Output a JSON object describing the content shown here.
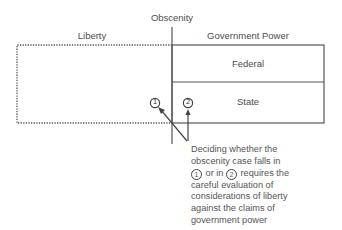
{
  "labels": {
    "top": "Obscenity",
    "left_region": "Liberty",
    "right_region": "Government Power",
    "federal": "Federal",
    "state": "State",
    "marker1": "1",
    "marker2": "2"
  },
  "caption": {
    "line1": "Deciding whether the",
    "line2": "obscenity case falls in",
    "line3_pre_marker1": "1",
    "line3_mid": "or in",
    "line3_marker2": "2",
    "line3_post": "requires the",
    "line4": "careful evaluation of",
    "line5": "considerations of liberty",
    "line6": "against the claims of",
    "line7": "government power"
  },
  "colors": {
    "line": "#555555",
    "text": "#4d4d4d"
  }
}
